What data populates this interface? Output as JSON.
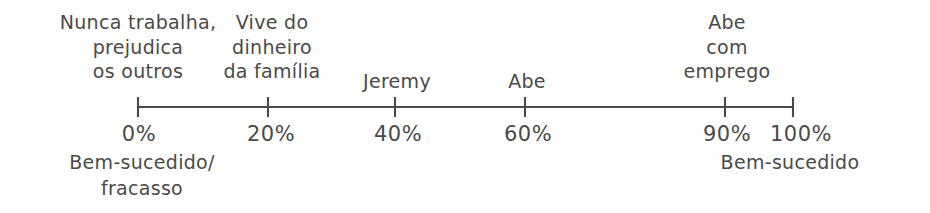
{
  "diagram": {
    "type": "number-line-scale",
    "ink_color": "#4a4a4a",
    "background_color": "#ffffff",
    "axis": {
      "start_percent": 0,
      "end_percent": 100,
      "start_x": 138,
      "end_x": 793,
      "line_y": 107
    },
    "ticks": [
      {
        "value_label": "0%",
        "x": 138,
        "percent": 0,
        "above_label": "Nunca trabalha,\nprejudica\nos outros"
      },
      {
        "value_label": "20%",
        "x": 268,
        "percent": 20,
        "above_label": "Vive do\ndinheiro\nda família"
      },
      {
        "value_label": "40%",
        "x": 395,
        "percent": 40,
        "above_label": "Jeremy"
      },
      {
        "value_label": "60%",
        "x": 525,
        "percent": 60,
        "above_label": "Abe"
      },
      {
        "value_label": "90%",
        "x": 725,
        "percent": 90,
        "above_label": "Abe\ncom\nemprego"
      },
      {
        "value_label": "100%",
        "x": 793,
        "percent": 100,
        "above_label": ""
      }
    ],
    "anchors": {
      "left": {
        "text": "Bem-sucedido/\nfracasso",
        "x": 138,
        "y": 152
      },
      "right": {
        "text": "Bem-sucedido",
        "x": 793,
        "y": 152
      }
    }
  }
}
